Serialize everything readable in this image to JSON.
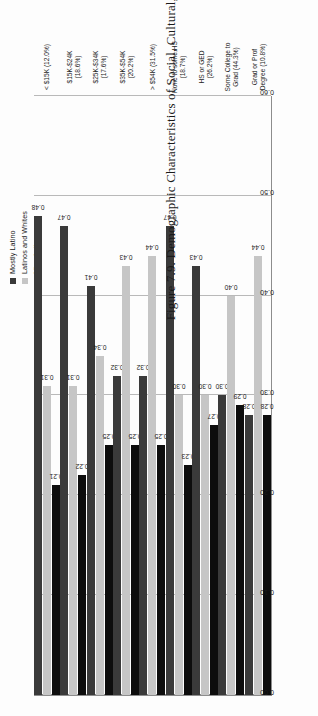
{
  "caption": "Figure 7.9. Demographic Characteristics of Social, Cultural, Civic, or Political Groups, by Income and Education",
  "legend": {
    "items": [
      {
        "label": "Mostly Latino",
        "color": "#3a3a3a",
        "swatch_icon": "square-swatch-icon"
      },
      {
        "label": "Latinos and Whites",
        "color": "#c6c6c6",
        "swatch_icon": "square-swatch-icon"
      },
      {
        "label": "Mix of all",
        "color": "#0d0d0d",
        "swatch_icon": "square-swatch-icon"
      }
    ]
  },
  "chart_data": {
    "type": "bar",
    "orientation": "horizontal",
    "title": "Figure 7.9. Demographic Characteristics of Social, Cultural, Civic, or Political Groups, by Income and Education",
    "xlabel": "",
    "ylabel": "",
    "xlim": [
      0.0,
      0.6
    ],
    "xticks": [
      "0.00",
      "0.10",
      "0.20",
      "0.30",
      "0.40",
      "0.50",
      "0.60"
    ],
    "xtick_values": [
      0.0,
      0.1,
      0.2,
      0.3,
      0.4,
      0.5,
      0.6
    ],
    "grid": true,
    "legend_position": "top-right",
    "categories": [
      "< $15K (12.0%)",
      "$15K-$24K (18.6%)",
      "$25K-$34K (17.6%)",
      "$35K-$54K (20.2%)",
      "> $54K (31.5%)",
      "None to some HS (18.7%)",
      "HS or GED (26.2%)",
      "Some College to Grad (44.3%)",
      "Grad or Prof Degree (10.8%)"
    ],
    "category_lines": [
      [
        "< $15K (12.0%)"
      ],
      [
        "$15K-$24K (18.6%)"
      ],
      [
        "$25K-$34K (17.6%)"
      ],
      [
        "$35K-$54K (20.2%)"
      ],
      [
        "> $54K (31.5%)"
      ],
      [
        "None to some HS",
        "(18.7%)"
      ],
      [
        "HS or GED (26.2%)"
      ],
      [
        "Some College to",
        "Grad (44.3%)"
      ],
      [
        "Grad or Prof",
        "Degree (10.8%)"
      ]
    ],
    "series": [
      {
        "name": "Mostly Latino",
        "color": "#3a3a3a",
        "values": [
          0.48,
          0.47,
          0.41,
          0.32,
          0.32,
          0.47,
          0.43,
          0.3,
          0.28
        ],
        "labels": [
          "0.48",
          "0.47",
          "0.41",
          "0.32",
          "0.32",
          "0.47",
          "0.43",
          "0.30",
          "0.28"
        ]
      },
      {
        "name": "Latinos and Whites",
        "color": "#c6c6c6",
        "values": [
          0.31,
          0.31,
          0.34,
          0.43,
          0.44,
          0.3,
          0.3,
          0.4,
          0.44
        ],
        "labels": [
          "0.31",
          "0.31",
          "0.34",
          "0.43",
          "0.44",
          "0.30",
          "0.30",
          "0.40",
          "0.44"
        ]
      },
      {
        "name": "Mix of all",
        "color": "#0d0d0d",
        "values": [
          0.21,
          0.22,
          0.25,
          0.25,
          0.25,
          0.23,
          0.27,
          0.29,
          0.28
        ],
        "labels": [
          "0.21",
          "0.22",
          "0.25",
          "0.25",
          "0.25",
          "0.23",
          "0.27",
          "0.29",
          "0.28"
        ]
      }
    ]
  }
}
